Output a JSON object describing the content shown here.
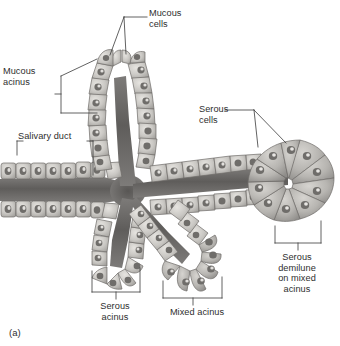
{
  "figure": {
    "panel_letter": "(a)",
    "background_color": "#ffffff",
    "ink_color": "#2e2e2e",
    "tissue_light": "#d8d6d2",
    "tissue_mid": "#b3b1ad",
    "tissue_dark": "#8b8986",
    "lumen_color": "#6f6d6b"
  },
  "labels": {
    "mucous_cells": "Mucous\ncells",
    "mucous_acinus": "Mucous\nacinus",
    "salivary_duct": "Salivary duct",
    "serous_cells": "Serous\ncells",
    "serous_demilune": "Serous\ndemilune\non mixed\nacinus",
    "serous_acinus": "Serous\nacinus",
    "mixed_acinus": "Mixed acinus"
  },
  "structures": [
    {
      "name": "salivary-duct",
      "label": "Salivary duct",
      "callout": "bracket-top-both-ends"
    },
    {
      "name": "mucous-acinus",
      "label": "Mucous acinus",
      "callout": "bracket-left"
    },
    {
      "name": "mucous-cells",
      "label": "Mucous cells",
      "callout": "two-leader-lines"
    },
    {
      "name": "serous-cells",
      "label": "Serous cells",
      "callout": "two-leader-lines"
    },
    {
      "name": "serous-demilune",
      "label": "Serous demilune on mixed acinus",
      "callout": "bracket-bottom"
    },
    {
      "name": "serous-acinus",
      "label": "Serous acinus",
      "callout": "bracket-bottom"
    },
    {
      "name": "mixed-acinus",
      "label": "Mixed acinus",
      "callout": "bracket-bottom"
    }
  ]
}
